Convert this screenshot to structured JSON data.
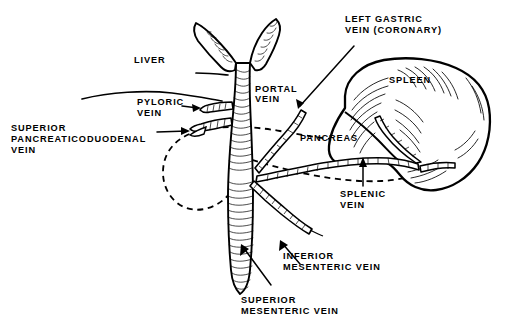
{
  "figure": {
    "background_color": "#ffffff",
    "ink_color": "#000000",
    "width": 508,
    "height": 323
  },
  "labels": {
    "liver": "LIVER",
    "pyloric_vein_l1": "PYLORIC",
    "pyloric_vein_l2": "VEIN",
    "superior_pancreaticoduodenal_l1": "SUPERIOR",
    "superior_pancreaticoduodenal_l2": "PANCREATICODUODENAL",
    "superior_pancreaticoduodenal_l3": "VEIN",
    "portal_vein_l1": "PORTAL",
    "portal_vein_l2": "VEIN",
    "left_gastric_l1": "LEFT GASTRIC",
    "left_gastric_l2": "VEIN (CORONARY)",
    "spleen": "SPLEEN",
    "pancreas": "PANCREAS",
    "splenic_vein_l1": "SPLENIC",
    "splenic_vein_l2": "VEIN",
    "inferior_mesenteric_l1": "INFERIOR",
    "inferior_mesenteric_l2": "MESENTERIC VEIN",
    "superior_mesenteric_l1": "SUPERIOR",
    "superior_mesenteric_l2": "MESENTERIC VEIN"
  },
  "structures": {
    "organs": [
      "liver",
      "spleen",
      "pancreas"
    ],
    "veins": [
      "portal vein",
      "pyloric vein",
      "superior pancreaticoduodenal vein",
      "left gastric vein (coronary)",
      "splenic vein",
      "inferior mesenteric vein",
      "superior mesenteric vein"
    ]
  }
}
